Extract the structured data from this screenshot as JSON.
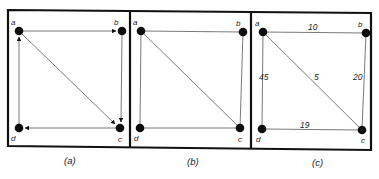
{
  "figure": {
    "panels": [
      {
        "id": "a",
        "caption": "(a)",
        "directed": true,
        "vertices": [
          {
            "label": "a",
            "x": 19,
            "y": 31
          },
          {
            "label": "b",
            "x": 122,
            "y": 31
          },
          {
            "label": "c",
            "x": 120,
            "y": 128
          },
          {
            "label": "d",
            "x": 19,
            "y": 128
          }
        ],
        "edges": [
          {
            "from": "a",
            "to": "b"
          },
          {
            "from": "b",
            "to": "c"
          },
          {
            "from": "a",
            "to": "c"
          },
          {
            "from": "c",
            "to": "d"
          },
          {
            "from": "d",
            "to": "a"
          }
        ]
      },
      {
        "id": "b",
        "caption": "(b)",
        "directed": false,
        "vertices": [
          {
            "label": "a",
            "x": 141,
            "y": 31
          },
          {
            "label": "b",
            "x": 243,
            "y": 32
          },
          {
            "label": "c",
            "x": 240,
            "y": 128
          },
          {
            "label": "d",
            "x": 140,
            "y": 128
          }
        ],
        "edges": [
          {
            "from": "a",
            "to": "b"
          },
          {
            "from": "b",
            "to": "c"
          },
          {
            "from": "a",
            "to": "c"
          },
          {
            "from": "c",
            "to": "d"
          },
          {
            "from": "d",
            "to": "a"
          }
        ]
      },
      {
        "id": "c",
        "caption": "(c)",
        "directed": false,
        "weighted": true,
        "vertices": [
          {
            "label": "a",
            "x": 263,
            "y": 32
          },
          {
            "label": "b",
            "x": 366,
            "y": 33
          },
          {
            "label": "c",
            "x": 362,
            "y": 130
          },
          {
            "label": "d",
            "x": 262,
            "y": 129
          }
        ],
        "edges": [
          {
            "from": "a",
            "to": "b",
            "weight": "10"
          },
          {
            "from": "b",
            "to": "c",
            "weight": "20"
          },
          {
            "from": "a",
            "to": "c",
            "weight": "5"
          },
          {
            "from": "d",
            "to": "c",
            "weight": "19"
          },
          {
            "from": "a",
            "to": "d",
            "weight": "45"
          }
        ]
      }
    ]
  },
  "labels": {
    "a": {
      "a": "a",
      "b": "b",
      "c": "c",
      "d": "d"
    },
    "b": {
      "a": "a",
      "b": "b",
      "c": "c",
      "d": "d"
    },
    "c": {
      "a": "a",
      "b": "b",
      "c": "c",
      "d": "d"
    }
  },
  "weights": {
    "ab": "10",
    "bc": "20",
    "ac": "5",
    "dc": "19",
    "ad": "45"
  },
  "captions": {
    "a": "(a)",
    "b": "(b)",
    "c": "(c)"
  }
}
